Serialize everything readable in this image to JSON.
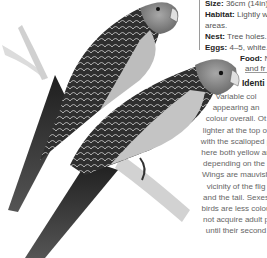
{
  "facts": {
    "size": {
      "label": "Size:",
      "value": "36cm (14in)"
    },
    "habitat": {
      "label": "Habitat:",
      "value": "Lightly w",
      "value_cont": "areas."
    },
    "nest": {
      "label": "Nest:",
      "value": "Tree holes."
    },
    "eggs": {
      "label": "Eggs:",
      "value": "4–5, white."
    },
    "food": {
      "label": "Food:",
      "value": "N",
      "value_cont": "and fr"
    }
  },
  "identification": {
    "title": "Identi",
    "lines": [
      "Variable col",
      "appearing an",
      "colour overall. Ot",
      "lighter at the top of",
      "with the scalloped p",
      "here both yellow an",
      "depending on the i",
      "Wings are mauvish",
      "vicinity of the flig",
      "and the tail. Sexes",
      "birds are less colou",
      "not acquire adult p",
      "until their second"
    ]
  },
  "colors": {
    "plumage_dark": "#2a2a2a",
    "plumage_mid": "#6e6e6e",
    "head": "#8c8c8c",
    "breast": "#c8c8c8",
    "branch": "#d6d6d6",
    "divider": "#9a9a9a"
  }
}
